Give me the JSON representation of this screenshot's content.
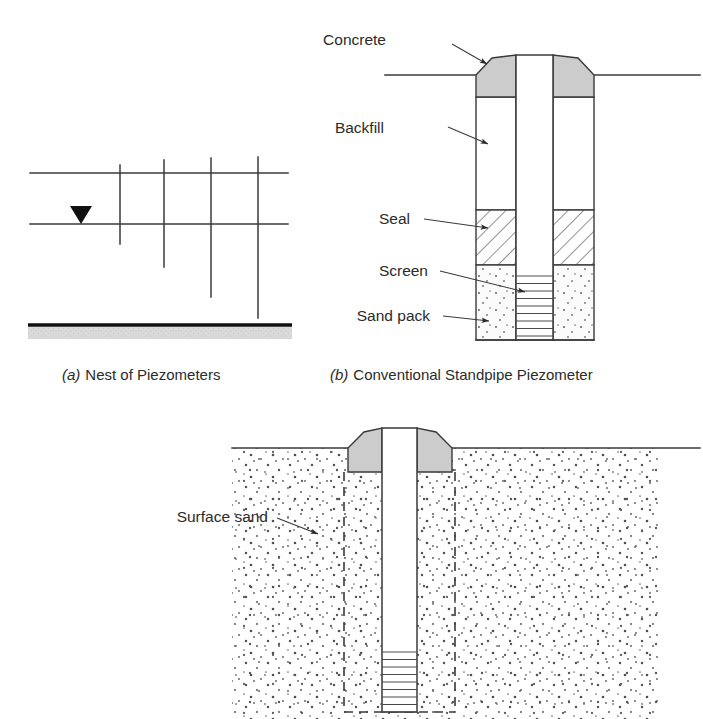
{
  "figure": {
    "background_color": "#ffffff",
    "line_color": "#3a3a3a",
    "concrete_fill": "#cccccc",
    "impermeable_fill": "#d6d6d6"
  },
  "panel_a": {
    "caption_letter": "(a)",
    "caption_text": "Nest of Piezometers",
    "ground_surface_label": "ground surface line",
    "water_table_label": "water table",
    "tube_count": 4,
    "tubes": [
      {
        "id": "tube-1",
        "x": 120,
        "top": 165,
        "bottom": 244
      },
      {
        "id": "tube-2",
        "x": 164,
        "top": 160,
        "bottom": 267
      },
      {
        "id": "tube-3",
        "x": 211,
        "top": 158,
        "bottom": 297
      },
      {
        "id": "tube-4",
        "x": 258,
        "top": 157,
        "bottom": 318
      }
    ],
    "surface_line": {
      "x1": 30,
      "x2": 288,
      "y": 173
    },
    "water_line": {
      "x1": 30,
      "x2": 288,
      "y": 224
    },
    "water_marker": {
      "x": 81,
      "y": 224,
      "shape": "filled-down-triangle"
    },
    "impermeable_layer": {
      "x1": 28,
      "x2": 292,
      "y": 325,
      "thickness": 3.4,
      "band_height": 12
    }
  },
  "panel_b": {
    "caption_letter": "(b)",
    "caption_text": "Conventional Standpipe Piezometer",
    "labels": [
      {
        "id": "concrete",
        "text": "Concrete"
      },
      {
        "id": "backfill",
        "text": "Backfill"
      },
      {
        "id": "seal",
        "text": "Seal"
      },
      {
        "id": "screen",
        "text": "Screen"
      },
      {
        "id": "sand-pack",
        "text": "Sand pack"
      }
    ],
    "ground_line": {
      "x1": 385,
      "x2": 700,
      "y": 75
    },
    "borehole": {
      "left": 476,
      "right": 594,
      "top": 75,
      "bottom": 340
    },
    "standpipe": {
      "left": 516,
      "right": 553,
      "top": 55,
      "bottom": 340
    },
    "zones": [
      {
        "id": "concrete",
        "top": 55,
        "bottom": 97,
        "pattern": "solid-gray"
      },
      {
        "id": "backfill",
        "top": 97,
        "bottom": 210,
        "pattern": "blank"
      },
      {
        "id": "seal",
        "top": 210,
        "bottom": 265,
        "pattern": "diagonal-hatch"
      },
      {
        "id": "sand-pack",
        "top": 265,
        "bottom": 340,
        "pattern": "stipple"
      }
    ],
    "screen": {
      "top": 268,
      "bottom": 338,
      "rung_count": 9
    }
  },
  "panel_c": {
    "labels": [
      {
        "id": "surface-sand",
        "text": "Surface sand"
      }
    ],
    "ground_line": {
      "x1": 232,
      "x2": 700,
      "y": 448
    },
    "sand_region": {
      "left": 232,
      "right": 660,
      "top": 448,
      "bottom": 719
    },
    "borehole_dashed": {
      "left": 344,
      "right": 455,
      "top": 472,
      "bottom": 712
    },
    "standpipe": {
      "left": 382,
      "right": 417,
      "top": 428,
      "bottom": 712
    },
    "concrete_cap": {
      "top": 428,
      "bottom": 472,
      "left": 348,
      "right": 452,
      "pattern": "solid-gray"
    },
    "screen": {
      "top": 645,
      "bottom": 712,
      "rung_count": 9
    }
  }
}
